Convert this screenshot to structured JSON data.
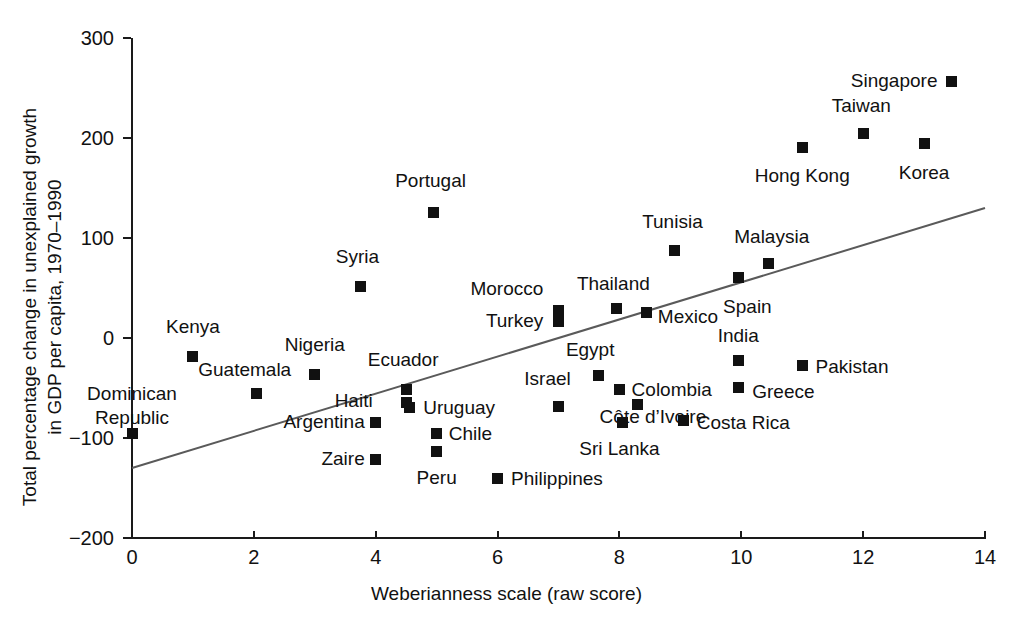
{
  "chart_data": {
    "type": "scatter",
    "title": "",
    "xlabel": "Weberianness scale (raw score)",
    "ylabel": "Total percentage change in unexplained growth in GDP per capita, 1970–1990",
    "xlim": [
      0,
      14
    ],
    "ylim": [
      -200,
      300
    ],
    "xticks": [
      "0",
      "2",
      "4",
      "6",
      "8",
      "10",
      "12",
      "14"
    ],
    "yticks": [
      "300",
      "200",
      "100",
      "0",
      "−100",
      "−200"
    ],
    "grid": false,
    "legend": "none",
    "marker": "filled-square",
    "marker_color": "#111111",
    "trendline": {
      "type": "linear-fit",
      "color": "#5a5a5a",
      "x_start": 0,
      "y_start": -130,
      "x_end": 14,
      "y_end": 130
    },
    "points": [
      {
        "label": "Kenya",
        "x": 1.0,
        "y": -18,
        "lx": 1.0,
        "ly": 12,
        "align": "center"
      },
      {
        "label": "Nigeria",
        "x": 3.0,
        "y": -36,
        "lx": 3.0,
        "ly": -6,
        "align": "center"
      },
      {
        "label": "Guatemala",
        "x": 2.05,
        "y": -55,
        "lx": 1.85,
        "ly": -31,
        "align": "center"
      },
      {
        "label": "Dominican\nRepublic",
        "x": 0.0,
        "y": -95,
        "lx": 0.0,
        "ly": -68,
        "align": "center"
      },
      {
        "label": "Ecuador",
        "x": 4.5,
        "y": -51,
        "lx": 4.45,
        "ly": -21,
        "align": "center"
      },
      {
        "label": "Haiti",
        "x": 4.5,
        "y": -64,
        "lx": 3.95,
        "ly": -62,
        "align": "left"
      },
      {
        "label": "Argentina",
        "x": 4.0,
        "y": -84,
        "lx": 3.82,
        "ly": -83,
        "align": "left"
      },
      {
        "label": "Zaire",
        "x": 4.0,
        "y": -121,
        "lx": 3.82,
        "ly": -120,
        "align": "left"
      },
      {
        "label": "Syria",
        "x": 3.75,
        "y": 52,
        "lx": 3.7,
        "ly": 82,
        "align": "center"
      },
      {
        "label": "Portugal",
        "x": 4.95,
        "y": 126,
        "lx": 4.9,
        "ly": 158,
        "align": "center"
      },
      {
        "label": "Uruguay",
        "x": 4.55,
        "y": -69,
        "lx": 4.78,
        "ly": -69,
        "align": "right"
      },
      {
        "label": "Chile",
        "x": 5.0,
        "y": -95,
        "lx": 5.2,
        "ly": -95,
        "align": "right"
      },
      {
        "label": "Peru",
        "x": 5.0,
        "y": -113,
        "lx": 5.0,
        "ly": -139,
        "align": "center"
      },
      {
        "label": "Philippines",
        "x": 6.0,
        "y": -140,
        "lx": 6.22,
        "ly": -140,
        "align": "right"
      },
      {
        "label": "Morocco",
        "x": 7.0,
        "y": 28,
        "lx": 6.75,
        "ly": 50,
        "align": "left"
      },
      {
        "label": "Turkey",
        "x": 7.0,
        "y": 17,
        "lx": 6.75,
        "ly": 18,
        "align": "left"
      },
      {
        "label": "Thailand",
        "x": 7.95,
        "y": 30,
        "lx": 7.9,
        "ly": 55,
        "align": "center"
      },
      {
        "label": "Mexico",
        "x": 8.45,
        "y": 26,
        "lx": 8.63,
        "ly": 22,
        "align": "right"
      },
      {
        "label": "Tunisia",
        "x": 8.9,
        "y": 88,
        "lx": 8.87,
        "ly": 117,
        "align": "center"
      },
      {
        "label": "Malaysia",
        "x": 10.45,
        "y": 75,
        "lx": 10.5,
        "ly": 102,
        "align": "center"
      },
      {
        "label": "Spain",
        "x": 9.95,
        "y": 61,
        "lx": 10.1,
        "ly": 32,
        "align": "center"
      },
      {
        "label": "Egypt",
        "x": 7.65,
        "y": -37,
        "lx": 7.52,
        "ly": -11,
        "align": "center"
      },
      {
        "label": "Israel",
        "x": 7.0,
        "y": -68,
        "lx": 6.82,
        "ly": -40,
        "align": "center"
      },
      {
        "label": "Colombia",
        "x": 8.0,
        "y": -51,
        "lx": 8.2,
        "ly": -51,
        "align": "right"
      },
      {
        "label": "Côte d’Ivoire",
        "x": 8.3,
        "y": -66,
        "lx": 8.55,
        "ly": -78,
        "align": "center"
      },
      {
        "label": "Sri Lanka",
        "x": 8.05,
        "y": -84,
        "lx": 8.0,
        "ly": -110,
        "align": "center"
      },
      {
        "label": "Costa Rica",
        "x": 9.05,
        "y": -82,
        "lx": 9.27,
        "ly": -84,
        "align": "right"
      },
      {
        "label": "India",
        "x": 9.95,
        "y": -22,
        "lx": 9.95,
        "ly": 3,
        "align": "center"
      },
      {
        "label": "Greece",
        "x": 9.95,
        "y": -49,
        "lx": 10.18,
        "ly": -53,
        "align": "right"
      },
      {
        "label": "Pakistan",
        "x": 11.0,
        "y": -27,
        "lx": 11.22,
        "ly": -28,
        "align": "right"
      },
      {
        "label": "Hong Kong",
        "x": 11.0,
        "y": 191,
        "lx": 11.0,
        "ly": 163,
        "align": "center"
      },
      {
        "label": "Taiwan",
        "x": 12.0,
        "y": 205,
        "lx": 11.97,
        "ly": 233,
        "align": "center"
      },
      {
        "label": "Korea",
        "x": 13.0,
        "y": 195,
        "lx": 13.0,
        "ly": 166,
        "align": "center"
      },
      {
        "label": "Singapore",
        "x": 13.45,
        "y": 257,
        "lx": 13.22,
        "ly": 258,
        "align": "left"
      }
    ]
  },
  "axes": {
    "x_title": "Weberianness scale (raw score)",
    "y_title_line1": "Total percentage change in unexplained growth",
    "y_title_line2": "in GDP per capita, 1970–1990"
  }
}
